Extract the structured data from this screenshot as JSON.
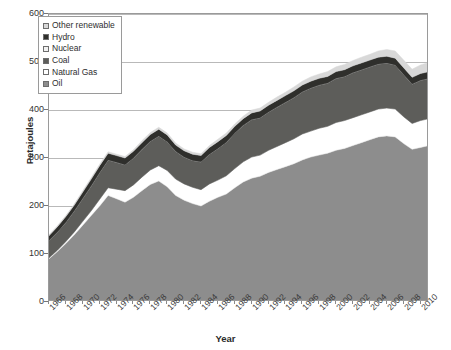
{
  "chart_data": {
    "type": "area",
    "stacked": true,
    "title": "",
    "xlabel": "Year",
    "ylabel": "Petajoules",
    "ylim": [
      0,
      600
    ],
    "ytick_values": [
      0,
      100,
      200,
      300,
      400,
      500,
      600
    ],
    "ytick_labels": [
      "0",
      "100",
      "200",
      "300",
      "400",
      "500",
      "600"
    ],
    "grid": true,
    "legend_position": "top-left",
    "xlim": [
      1966,
      2011
    ],
    "xtick_values": [
      1966,
      1968,
      1970,
      1972,
      1974,
      1976,
      1978,
      1980,
      1982,
      1984,
      1986,
      1988,
      1990,
      1992,
      1994,
      1996,
      1998,
      2000,
      2002,
      2004,
      2006,
      2008,
      2010
    ],
    "xtick_labels": [
      "1966",
      "1968",
      "1970",
      "1972",
      "1974",
      "1976",
      "1978",
      "1980",
      "1982",
      "1984",
      "1986",
      "1988",
      "1990",
      "1992",
      "1994",
      "1996",
      "1998",
      "2000",
      "2002",
      "2004",
      "2006",
      "2008",
      "2010"
    ],
    "x": [
      1966,
      1967,
      1968,
      1969,
      1970,
      1971,
      1972,
      1973,
      1974,
      1975,
      1976,
      1977,
      1978,
      1979,
      1980,
      1981,
      1982,
      1983,
      1984,
      1985,
      1986,
      1987,
      1988,
      1989,
      1990,
      1991,
      1992,
      1993,
      1994,
      1995,
      1996,
      1997,
      1998,
      1999,
      2000,
      2001,
      2002,
      2003,
      2004,
      2005,
      2006,
      2007,
      2008,
      2009,
      2010,
      2011
    ],
    "series": [
      {
        "name": "Oil",
        "color": "#8d8d8d",
        "values": [
          90,
          105,
          122,
          140,
          160,
          180,
          200,
          222,
          215,
          208,
          218,
          232,
          245,
          252,
          240,
          222,
          212,
          205,
          200,
          210,
          218,
          225,
          238,
          250,
          258,
          262,
          270,
          276,
          282,
          288,
          296,
          302,
          306,
          310,
          316,
          320,
          326,
          332,
          338,
          344,
          346,
          344,
          330,
          318,
          322,
          326
        ]
      },
      {
        "name": "Natural Gas",
        "color": "#ffffff",
        "values": [
          2,
          3,
          4,
          6,
          8,
          10,
          14,
          16,
          20,
          24,
          26,
          28,
          30,
          32,
          34,
          34,
          34,
          34,
          34,
          36,
          36,
          38,
          40,
          42,
          44,
          44,
          46,
          48,
          50,
          52,
          54,
          54,
          56,
          56,
          58,
          58,
          58,
          58,
          58,
          58,
          58,
          58,
          56,
          54,
          56,
          56
        ]
      },
      {
        "name": "Coal",
        "color": "#5d5d5a",
        "values": [
          36,
          38,
          40,
          44,
          48,
          52,
          56,
          58,
          56,
          54,
          56,
          58,
          60,
          62,
          60,
          58,
          56,
          56,
          58,
          62,
          66,
          70,
          74,
          76,
          78,
          78,
          80,
          82,
          84,
          86,
          88,
          90,
          90,
          90,
          92,
          92,
          94,
          94,
          94,
          94,
          94,
          92,
          88,
          82,
          84,
          84
        ]
      },
      {
        "name": "Nuclear",
        "color": "#d0d0d0",
        "values": [
          0,
          0,
          0,
          0,
          0,
          0,
          0,
          0,
          0,
          0,
          0,
          0,
          0,
          0,
          0,
          0,
          0,
          0,
          0,
          0,
          0,
          0,
          0,
          0,
          0,
          0,
          0,
          0,
          0,
          0,
          0,
          0,
          0,
          0,
          0,
          0,
          0,
          0,
          0,
          0,
          0,
          0,
          0,
          0,
          0,
          0
        ]
      },
      {
        "name": "Hydro",
        "color": "#2f2f2c",
        "values": [
          10,
          11,
          12,
          12,
          13,
          14,
          14,
          14,
          14,
          14,
          14,
          14,
          14,
          14,
          14,
          13,
          13,
          13,
          13,
          14,
          14,
          14,
          14,
          14,
          14,
          14,
          14,
          14,
          14,
          14,
          14,
          14,
          14,
          14,
          14,
          14,
          14,
          14,
          14,
          14,
          14,
          14,
          14,
          14,
          14,
          14
        ]
      },
      {
        "name": "Other renewable",
        "color": "#d8d8d8",
        "values": [
          2,
          2,
          2,
          2,
          3,
          3,
          3,
          3,
          3,
          3,
          3,
          4,
          4,
          4,
          4,
          4,
          4,
          4,
          4,
          4,
          5,
          5,
          5,
          5,
          6,
          6,
          6,
          7,
          7,
          8,
          8,
          9,
          9,
          10,
          10,
          11,
          11,
          12,
          12,
          13,
          14,
          15,
          16,
          17,
          18,
          19
        ]
      }
    ],
    "stack_order_bottom_to_top": [
      "Oil",
      "Natural Gas",
      "Coal",
      "Nuclear",
      "Hydro",
      "Other renewable"
    ]
  },
  "legend": {
    "items": [
      {
        "label": "Other renewable",
        "color": "#d8d8d8"
      },
      {
        "label": "Hydro",
        "color": "#2f2f2c"
      },
      {
        "label": "Nuclear",
        "color": "#f2f2f2"
      },
      {
        "label": "Coal",
        "color": "#5d5d5a"
      },
      {
        "label": "Natural Gas",
        "color": "#ffffff"
      },
      {
        "label": "Oil",
        "color": "#8d8d8d"
      }
    ]
  }
}
